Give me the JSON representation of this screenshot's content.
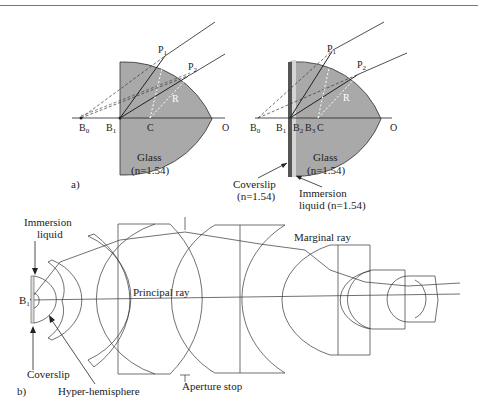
{
  "figure": {
    "panel_a": {
      "label": "a)",
      "left": {
        "points": {
          "B0": "B",
          "B0_sub": "0",
          "B1": "B",
          "B1_sub": "1",
          "C": "C",
          "O": "O",
          "P1": "P",
          "P1_sub": "1",
          "P2": "P",
          "P2_sub": "2",
          "R": "R"
        },
        "material": "Glass",
        "index": "(n=1.54)"
      },
      "right": {
        "points": {
          "B0": "B",
          "B0_sub": "0",
          "B1": "B",
          "B1_sub": "1",
          "B2": "B",
          "B2_sub": "2",
          "B3": "B",
          "B3_sub": "3",
          "C": "C",
          "O": "O",
          "P1": "P",
          "P1_sub": "1",
          "P2": "P",
          "P2_sub": "2",
          "R": "R"
        },
        "material": "Glass",
        "index": "(n=1.54)",
        "coverslip_label": "Coverslip",
        "coverslip_index": "(n=1.54)",
        "immersion_label": "Immersion",
        "immersion_index": "liquid (n=1.54)"
      }
    },
    "panel_b": {
      "label": "b)",
      "immersion_line1": "Immersion",
      "immersion_line2": "liquid",
      "b1": "B",
      "b1_sub": "1",
      "coverslip": "Coverslip",
      "hyper_hemisphere": "Hyper-hemisphere",
      "principal_ray": "Principal ray",
      "marginal_ray": "Marginal ray",
      "aperture_stop": "Aperture stop"
    },
    "colors": {
      "glass": "#a9a9a9",
      "coverslip": "#555555",
      "immersion": "#d4d4d4",
      "line": "#222222"
    }
  }
}
